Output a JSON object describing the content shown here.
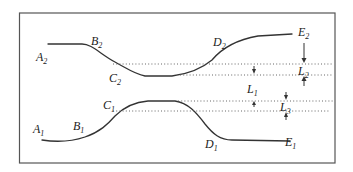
{
  "diagram": {
    "title": "",
    "curves": [
      {
        "name": "upper-curve",
        "points": [
          "A2",
          "B2",
          "C2",
          "D2",
          "E2"
        ]
      },
      {
        "name": "lower-curve",
        "points": [
          "A1",
          "B1",
          "C1",
          "D1",
          "E1"
        ]
      }
    ],
    "labels": {
      "A2": {
        "base": "A",
        "sub": "2"
      },
      "B2": {
        "base": "B",
        "sub": "2"
      },
      "C2": {
        "base": "C",
        "sub": "2"
      },
      "D2": {
        "base": "D",
        "sub": "2"
      },
      "E2": {
        "base": "E",
        "sub": "2"
      },
      "A1": {
        "base": "A",
        "sub": "1"
      },
      "B1": {
        "base": "B",
        "sub": "1"
      },
      "C1": {
        "base": "C",
        "sub": "1"
      },
      "D1": {
        "base": "D",
        "sub": "1"
      },
      "E1": {
        "base": "E",
        "sub": "1"
      },
      "L1": {
        "base": "L",
        "sub": "1"
      },
      "L2": {
        "base": "L",
        "sub": "2"
      },
      "L3": {
        "base": "L",
        "sub": "3"
      }
    },
    "dimensions": [
      "L1",
      "L2",
      "L3"
    ],
    "colors": {
      "line": "#333333",
      "frame": "#555555",
      "background": "#ffffff"
    }
  }
}
